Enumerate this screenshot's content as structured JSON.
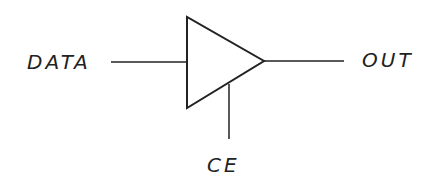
{
  "diagram": {
    "labels": {
      "input": "DATA",
      "output": "OUT",
      "control": "CE"
    },
    "colors": {
      "stroke": "#222222",
      "background": "#ffffff"
    }
  }
}
